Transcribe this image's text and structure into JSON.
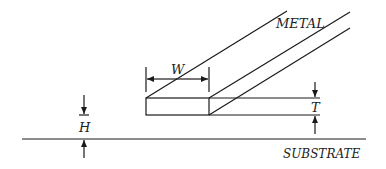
{
  "diagram": {
    "labels": {
      "metal": "METAL",
      "substrate": "SUBSTRATE",
      "width": "W",
      "thickness": "T",
      "height": "H"
    },
    "colors": {
      "stroke": "#1a1a1a",
      "text": "#222222",
      "background": "#ffffff"
    }
  }
}
